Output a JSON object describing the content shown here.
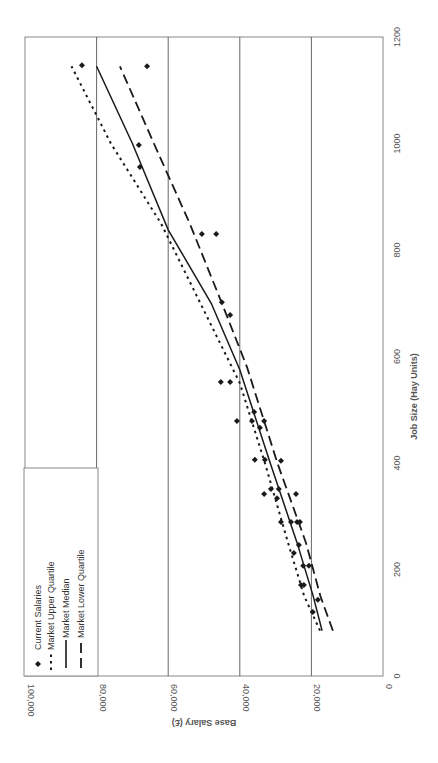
{
  "chart_data": {
    "type": "scatter",
    "orientation_note_visible": "rotated 90deg clockwise on page",
    "title": "",
    "xlabel": "Job Size (Hay Units)",
    "ylabel": "Base Salary (£)",
    "xlim": [
      0,
      1200
    ],
    "ylim": [
      0,
      100000
    ],
    "x_ticks": [
      0,
      200,
      400,
      600,
      800,
      1000,
      1200
    ],
    "y_ticks": [
      0,
      20000,
      40000,
      60000,
      80000,
      100000
    ],
    "x_tick_labels": [
      "0",
      "200",
      "400",
      "600",
      "800",
      "1000",
      "1200"
    ],
    "y_tick_labels": [
      "0",
      "20,000",
      "40,000",
      "60,000",
      "80,000",
      "100,000"
    ],
    "grid": "horizontal (salary) gridlines only",
    "legend_position": "upper left (inside plot)",
    "series": [
      {
        "name": "Current Salaries",
        "style": "diamond markers",
        "points": [
          [
            1147,
            84100
          ],
          [
            1145,
            65900
          ],
          [
            997,
            68200
          ],
          [
            956,
            67900
          ],
          [
            830,
            50600
          ],
          [
            830,
            46600
          ],
          [
            702,
            45000
          ],
          [
            678,
            42700
          ],
          [
            552,
            45300
          ],
          [
            552,
            42700
          ],
          [
            496,
            36000
          ],
          [
            479,
            40800
          ],
          [
            479,
            36600
          ],
          [
            479,
            33200
          ],
          [
            466,
            34400
          ],
          [
            406,
            35800
          ],
          [
            406,
            33000
          ],
          [
            404,
            28500
          ],
          [
            351,
            31300
          ],
          [
            351,
            29100
          ],
          [
            342,
            33200
          ],
          [
            334,
            29600
          ],
          [
            342,
            24300
          ],
          [
            289,
            28500
          ],
          [
            289,
            25700
          ],
          [
            289,
            24000
          ],
          [
            289,
            23200
          ],
          [
            246,
            23500
          ],
          [
            231,
            24900
          ],
          [
            207,
            22300
          ],
          [
            207,
            20700
          ],
          [
            171,
            22900
          ],
          [
            171,
            22100
          ],
          [
            143,
            18200
          ],
          [
            120,
            19600
          ]
        ]
      },
      {
        "name": "Market Upper Quartile",
        "style": "dotted line",
        "points": [
          [
            85,
            17600
          ],
          [
            150,
            22000
          ],
          [
            250,
            26500
          ],
          [
            400,
            33000
          ],
          [
            550,
            40000
          ],
          [
            700,
            51000
          ],
          [
            850,
            62000
          ],
          [
            1000,
            76000
          ],
          [
            1145,
            87000
          ]
        ]
      },
      {
        "name": "Market Median",
        "style": "solid line",
        "points": [
          [
            85,
            17000
          ],
          [
            150,
            19500
          ],
          [
            250,
            24000
          ],
          [
            400,
            31500
          ],
          [
            575,
            40000
          ],
          [
            700,
            48000
          ],
          [
            838,
            60000
          ],
          [
            1000,
            70000
          ],
          [
            1145,
            80000
          ]
        ]
      },
      {
        "name": "Market Lower Quartile",
        "style": "dashed line",
        "points": [
          [
            85,
            14000
          ],
          [
            150,
            17500
          ],
          [
            250,
            21500
          ],
          [
            400,
            29500
          ],
          [
            580,
            38000
          ],
          [
            700,
            45000
          ],
          [
            850,
            54000
          ],
          [
            1000,
            64000
          ],
          [
            1145,
            73500
          ]
        ]
      }
    ]
  },
  "legend": {
    "items": [
      {
        "label": "Current Salaries",
        "icon": "diamond-marker-icon"
      },
      {
        "label": "Market Upper Quartile",
        "icon": "dotted-line-icon"
      },
      {
        "label": "Market Median",
        "icon": "solid-line-icon"
      },
      {
        "label": "Market Lower Quartile",
        "icon": "dashed-line-icon"
      }
    ]
  },
  "colors": {
    "series": "#1a1a1a",
    "grid": "#555555",
    "axis_text": "#555555",
    "frame": "#888888"
  }
}
